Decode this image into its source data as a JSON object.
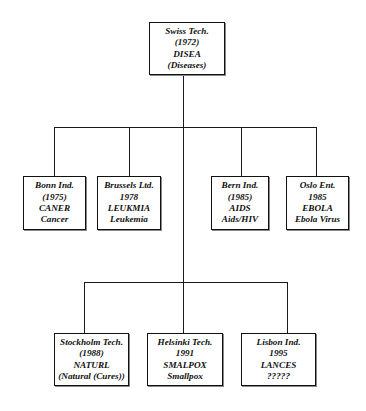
{
  "diagram": {
    "type": "org-chart-tree",
    "root": {
      "id": "swiss",
      "lines": [
        "Swiss Tech.",
        "(1972)",
        "DISEA",
        "(Diseases)"
      ]
    },
    "level1": [
      {
        "id": "bonn",
        "lines": [
          "Bonn Ind.",
          "(1975)",
          "CANER",
          "Cancer"
        ]
      },
      {
        "id": "brussels",
        "lines": [
          "Brussels Ltd.",
          "1978",
          "LEUKMIA",
          "Leukemia"
        ]
      },
      {
        "id": "bern",
        "lines": [
          "Bern Ind.",
          "(1985)",
          "AIDS",
          "Aids/HIV"
        ]
      },
      {
        "id": "oslo",
        "lines": [
          "Oslo Ent.",
          "1985",
          "EBOLA",
          "Ebola Virus"
        ]
      }
    ],
    "level2": [
      {
        "id": "stockholm",
        "lines": [
          "Stockholm Tech.",
          "(1988)",
          "NATURL",
          "(Natural (Cures))"
        ]
      },
      {
        "id": "helsinki",
        "lines": [
          "Helsinki Tech.",
          "1991",
          "SMALPOX",
          "Smallpox"
        ]
      },
      {
        "id": "lisbon",
        "lines": [
          "Lisbon Ind.",
          "1995",
          "LANCES",
          "?????"
        ]
      }
    ],
    "colors": {
      "line": "#1a1a1a",
      "box_border": "#111111",
      "text": "#111111",
      "background": "#ffffff"
    }
  }
}
